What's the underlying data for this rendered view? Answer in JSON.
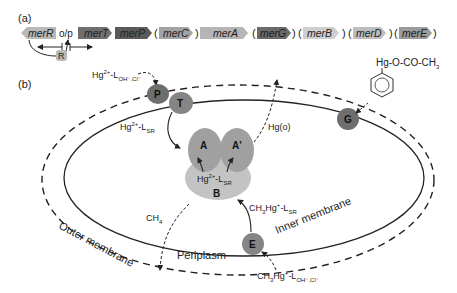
{
  "panel_a": {
    "label": "(a)",
    "operator_label": "o/p",
    "regulator_label": "R",
    "genes": [
      {
        "name": "merR",
        "color": "#b9b9b9",
        "direction": "left",
        "optional": false
      },
      {
        "name": "merT",
        "color": "#6f6f6f",
        "direction": "right",
        "optional": false
      },
      {
        "name": "merP",
        "color": "#5a5a5a",
        "direction": "right",
        "optional": false
      },
      {
        "name": "merC",
        "color": "#a3a3a3",
        "direction": "right",
        "optional": true
      },
      {
        "name": "merA",
        "color": "#b5b5b5",
        "direction": "right",
        "optional": false
      },
      {
        "name": "merG",
        "color": "#6a6a6a",
        "direction": "right",
        "optional": true
      },
      {
        "name": "merB",
        "color": "#cfcfcf",
        "direction": "right",
        "optional": true
      },
      {
        "name": "merD",
        "color": "#bdbdbd",
        "direction": "right",
        "optional": true
      },
      {
        "name": "merE",
        "color": "#9a9a9a",
        "direction": "right",
        "optional": true
      }
    ]
  },
  "panel_b": {
    "label": "(b)",
    "proteins": {
      "P": "P",
      "T": "T",
      "G": "G",
      "A": "A",
      "A_prime": "A'",
      "B": "B",
      "E": "E"
    },
    "species": {
      "hg_in_outer": {
        "main": "Hg",
        "sup": "2+",
        "mid": "-L",
        "sub": "OH⁻,Cl⁻"
      },
      "hg_sr_periplasm": {
        "main": "Hg",
        "sup": "2+",
        "mid": "-L",
        "sub": "SR"
      },
      "hg_sr_complex": {
        "main": "Hg",
        "sup": "2+",
        "mid": "-L",
        "sub": "SR"
      },
      "hg0": "Hg(o)",
      "ch4": {
        "main": "CH",
        "sub": "4"
      },
      "mehg_sr": {
        "pre": "CH",
        "pre_sub": "3",
        "main": "Hg",
        "sup": "+",
        "mid": "-L",
        "sub": "SR"
      },
      "mehg_in": {
        "pre": "CH",
        "pre_sub": "3",
        "main": "Hg",
        "sup": "+",
        "mid": "-L",
        "sub": "OH⁻,Cl⁻"
      },
      "phenylmercury": {
        "main": "Hg-O-CO-CH",
        "sub": "3"
      }
    },
    "membranes": {
      "outer": "Outer membrane",
      "inner": "Inner membrane",
      "periplasm": "Periplasm"
    },
    "colors": {
      "dark_protein": "#6e6e6e",
      "mid_protein": "#8c8c8c",
      "light_protein": "#a9a9a9",
      "lightest_protein": "#c3c3c3"
    }
  }
}
